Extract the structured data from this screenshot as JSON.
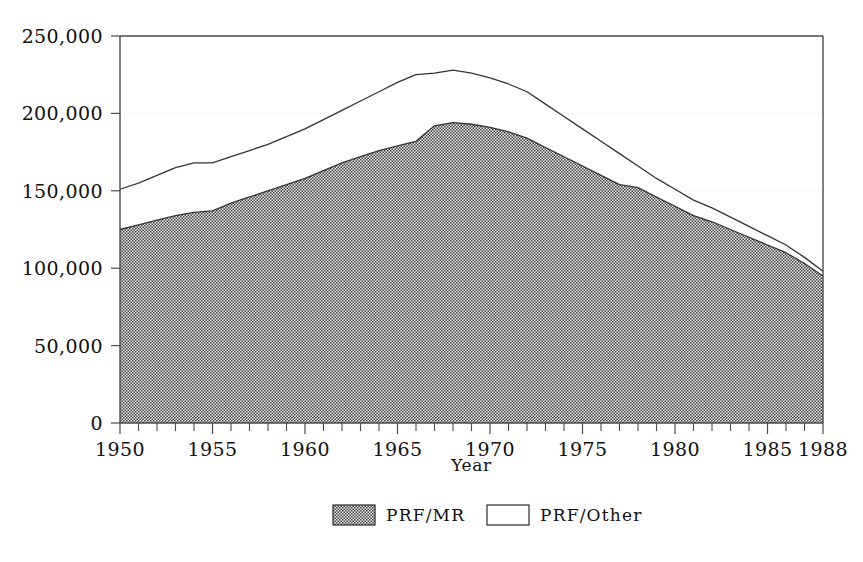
{
  "chart_data": {
    "type": "area",
    "stacked": true,
    "title": "",
    "subtitle": "",
    "xlabel": "Year",
    "ylabel": "",
    "xlim": [
      1950,
      1988
    ],
    "ylim": [
      0,
      250000
    ],
    "grid": true,
    "grid_style": "faint dotted horizontal gridlines at major y ticks",
    "legend_position": "bottom-center",
    "x": [
      1950,
      1951,
      1952,
      1953,
      1954,
      1955,
      1956,
      1957,
      1958,
      1959,
      1960,
      1961,
      1962,
      1963,
      1964,
      1965,
      1966,
      1967,
      1968,
      1969,
      1970,
      1971,
      1972,
      1973,
      1974,
      1975,
      1976,
      1977,
      1978,
      1979,
      1980,
      1981,
      1982,
      1983,
      1984,
      1985,
      1986,
      1987,
      1988
    ],
    "categories": [
      "1950",
      "1951",
      "1952",
      "1953",
      "1954",
      "1955",
      "1956",
      "1957",
      "1958",
      "1959",
      "1960",
      "1961",
      "1962",
      "1963",
      "1964",
      "1965",
      "1966",
      "1967",
      "1968",
      "1969",
      "1970",
      "1971",
      "1972",
      "1973",
      "1974",
      "1975",
      "1976",
      "1977",
      "1978",
      "1979",
      "1980",
      "1981",
      "1982",
      "1983",
      "1984",
      "1985",
      "1986",
      "1987",
      "1988"
    ],
    "series": [
      {
        "name": "PRF/MR",
        "fill": "hatched-dark-gray",
        "color": "#6b6b6b",
        "values": [
          125000,
          128000,
          131000,
          134000,
          136000,
          137000,
          142000,
          146000,
          150000,
          154000,
          158000,
          163000,
          168000,
          172000,
          176000,
          179000,
          182000,
          192000,
          194000,
          193000,
          191000,
          188000,
          184000,
          178000,
          172000,
          166000,
          160000,
          154000,
          152000,
          146000,
          140000,
          134000,
          130000,
          125000,
          120000,
          115000,
          110000,
          103000,
          95000
        ]
      },
      {
        "name": "PRF/Other",
        "fill": "white-outlined",
        "color": "#ffffff",
        "values": [
          26000,
          27000,
          29000,
          31000,
          32000,
          31000,
          30000,
          30000,
          30000,
          31000,
          32000,
          33000,
          34000,
          36000,
          38000,
          41000,
          43000,
          34000,
          34000,
          33000,
          32000,
          31000,
          30000,
          28000,
          26000,
          24000,
          22000,
          20000,
          14000,
          12000,
          11000,
          10000,
          9000,
          8000,
          7000,
          6000,
          5000,
          4000,
          3000
        ]
      }
    ],
    "totals": [
      151000,
      155000,
      160000,
      165000,
      168000,
      168000,
      172000,
      176000,
      180000,
      185000,
      190000,
      196000,
      202000,
      208000,
      214000,
      220000,
      225000,
      226000,
      228000,
      226000,
      223000,
      219000,
      214000,
      206000,
      198000,
      190000,
      182000,
      174000,
      166000,
      158000,
      151000,
      144000,
      139000,
      133000,
      127000,
      121000,
      115000,
      107000,
      98000
    ],
    "yticks": [
      0,
      50000,
      100000,
      150000,
      200000,
      250000
    ],
    "ytick_labels": [
      "0",
      "50,000",
      "100,000",
      "150,000",
      "200,000",
      "250,000"
    ],
    "xticks": [
      1950,
      1955,
      1960,
      1965,
      1970,
      1975,
      1980,
      1985,
      1988
    ],
    "xtick_labels": [
      "1950",
      "1955",
      "1960",
      "1965",
      "1970",
      "1975",
      "1980",
      "1985",
      "1988"
    ],
    "xtick_minor_every": 1
  },
  "legend": {
    "items": [
      {
        "label": "PRF/MR",
        "swatch": "hatched-dark-gray"
      },
      {
        "label": "PRF/Other",
        "swatch": "white-outlined"
      }
    ]
  },
  "axes": {
    "x_title": "Year",
    "y_title": ""
  },
  "colors": {
    "series_prf_mr": "#6b6b6b",
    "series_prf_other": "#ffffff",
    "axis": "#4a4a4a",
    "line": "#333333",
    "grid": "#cfcfcf",
    "text": "#101010",
    "background": "#ffffff"
  }
}
